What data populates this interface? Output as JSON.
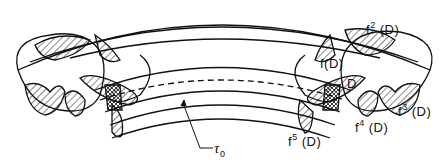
{
  "figure": {
    "type": "torus-map-diagram",
    "labels": {
      "f2": {
        "base": "f",
        "exp": "2",
        "arg": "(D)"
      },
      "f1": {
        "text": "f(D)"
      },
      "D": {
        "text": "D"
      },
      "f3": {
        "base": "f",
        "exp": "3",
        "arg": "(D)"
      },
      "f4": {
        "base": "f",
        "exp": "4",
        "arg": "(D)"
      },
      "f5": {
        "base": "f",
        "exp": "5",
        "arg": "(D)"
      },
      "tau": {
        "base": "τ",
        "sub": "0"
      }
    },
    "colors": {
      "ink": "#111111",
      "background": "#ffffff"
    }
  }
}
